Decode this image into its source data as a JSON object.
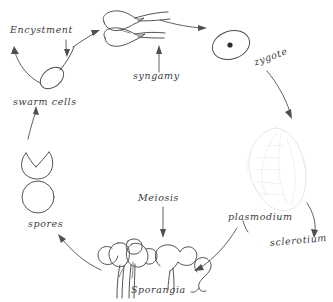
{
  "diagram": {
    "type": "life-cycle-diagram",
    "style": "hand-drawn line art",
    "background_color": "#ffffff",
    "ink_color": "#4a4a4a",
    "faint_ink_color": "#e2e2e2"
  },
  "labels": {
    "encystment": "Encystment",
    "swarm_cells": "swarm cells",
    "syngamy": "syngamy",
    "zygote": "zygote",
    "plasmodium": "plasmodium",
    "sclerotium": "sclerotium",
    "sporangia": "Sporangia",
    "meiosis": "Meiosis",
    "spores": "spores"
  },
  "stages": [
    {
      "id": "swarm-cells",
      "label": "swarm cells",
      "shape": "flagellated ellipse",
      "position": {
        "x": 52,
        "y": 78
      }
    },
    {
      "id": "gametes-fusing",
      "label": "syngamy",
      "shape": "two amoeboid cells fusing",
      "position": {
        "x": 133,
        "y": 30
      }
    },
    {
      "id": "zygote",
      "label": "zygote",
      "shape": "ellipse with nucleus",
      "position": {
        "x": 232,
        "y": 45
      }
    },
    {
      "id": "plasmodium",
      "label": "plasmodium",
      "shape": "lobed veined mass",
      "position": {
        "x": 277,
        "y": 172
      }
    },
    {
      "id": "sporangium-single",
      "label": "Sporangia",
      "shape": "stalked sporangium",
      "position": {
        "x": 200,
        "y": 272
      }
    },
    {
      "id": "sporangia-cluster",
      "label": "Sporangia",
      "shape": "cluster of stalked sporangia",
      "position": {
        "x": 124,
        "y": 262
      }
    },
    {
      "id": "spore",
      "label": "spores",
      "shape": "circle",
      "position": {
        "x": 38,
        "y": 197
      }
    },
    {
      "id": "germinating-spore",
      "label": "spores",
      "shape": "circle splitting open",
      "position": {
        "x": 38,
        "y": 160
      }
    }
  ],
  "transitions": [
    {
      "from": "spores",
      "to": "swarm cells",
      "label": ""
    },
    {
      "from": "swarm cells",
      "to": "syngamy",
      "label": ""
    },
    {
      "from": "swarm cells",
      "to": "Encystment",
      "label": "Encystment"
    },
    {
      "from": "syngamy",
      "to": "zygote",
      "label": "syngamy"
    },
    {
      "from": "zygote",
      "to": "plasmodium",
      "label": ""
    },
    {
      "from": "plasmodium",
      "to": "sclerotium",
      "label": "sclerotium"
    },
    {
      "from": "plasmodium",
      "to": "Sporangia",
      "label": ""
    },
    {
      "from": "Sporangia",
      "to": "spores",
      "label": ""
    },
    {
      "from": "Sporangia",
      "to": "Meiosis",
      "label": "Meiosis"
    }
  ]
}
